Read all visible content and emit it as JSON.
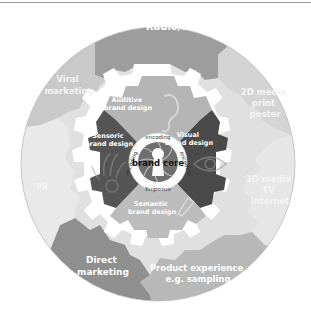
{
  "outer_ring": {
    "segments": [
      {
        "id": "radio",
        "label_lines": [
          "Radio/telephone"
        ],
        "color": "#9d9d9d"
      },
      {
        "id": "print",
        "label_lines": [
          "2D media",
          "print",
          "poster"
        ],
        "color": "#d4d4d4"
      },
      {
        "id": "tv",
        "label_lines": [
          "3D media",
          "TV",
          "internet"
        ],
        "color": "#e6e6e6"
      },
      {
        "id": "product",
        "label_lines": [
          "Product experience",
          "e.g. sampling"
        ],
        "color": "#b8b8b8"
      },
      {
        "id": "direct",
        "label_lines": [
          "Direct",
          "marketing"
        ],
        "color": "#8f8f8f"
      },
      {
        "id": "pr",
        "label_lines": [
          "PR"
        ],
        "color": "#e9e9e9"
      },
      {
        "id": "viral",
        "label_lines": [
          "Viral",
          "marketing"
        ],
        "color": "#c9c9c9"
      }
    ]
  },
  "gear": {
    "quadrants": [
      {
        "id": "auditive",
        "label_lines": [
          "Auditive",
          "brand design"
        ],
        "icon": "ear-icon",
        "color": "#b5b5b5"
      },
      {
        "id": "visual",
        "label_lines": [
          "Visual",
          "brand design"
        ],
        "icon": "eye-icon",
        "color": "#4a4a4a"
      },
      {
        "id": "semantic",
        "label_lines": [
          "Semantic",
          "brand design"
        ],
        "icon": "megaphone-icon",
        "color": "#bcbcbc"
      },
      {
        "id": "sensoric",
        "label_lines": [
          "Sensoric",
          "brand design"
        ],
        "icon": "hand-icon",
        "color": "#555555"
      }
    ]
  },
  "core": {
    "label": "brand core",
    "ring_words": [
      "encoding",
      "encoding",
      "encoding",
      "encoding"
    ],
    "icon": "keyhole-icon"
  }
}
